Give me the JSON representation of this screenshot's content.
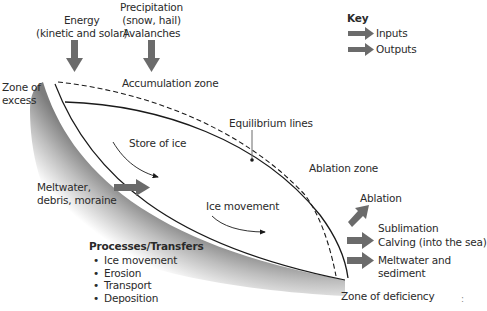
{
  "colors": {
    "arrow": "#6b6b6b",
    "line": "#1a1a1a",
    "bedrock_dark": "#8a8a8a",
    "bedrock_light": "#ffffff",
    "text": "#2a2a2a"
  },
  "inputs": {
    "energy": [
      "Energy",
      "(kinetic and solar)"
    ],
    "precipitation": [
      "Precipitation",
      "(snow, hail)",
      "Avalanches"
    ]
  },
  "key": {
    "title": "Key",
    "items": [
      {
        "label": "Inputs",
        "icon": "arrow-right-icon"
      },
      {
        "label": "Outputs",
        "icon": "arrow-right-icon"
      }
    ]
  },
  "zones": {
    "excess": [
      "Zone of",
      "excess"
    ],
    "accumulation": "Accumulation zone",
    "ablation": "Ablation zone",
    "deficiency": "Zone of deficiency"
  },
  "labels": {
    "equilibrium_lines": "Equilibrium lines",
    "store_of_ice": "Store of ice",
    "ice_movement": "Ice movement",
    "meltwater_input": [
      "Meltwater,",
      "debris, moraine"
    ]
  },
  "outputs": {
    "ablation": "Ablation",
    "sublimation": "Sublimation",
    "calving": "Calving (into the sea)",
    "meltwater": [
      "Meltwater and",
      "sediment"
    ]
  },
  "processes": {
    "title": "Processes/Transfers",
    "items": [
      "Ice movement",
      "Erosion",
      "Transport",
      "Deposition"
    ]
  },
  "corner_mark": ":"
}
